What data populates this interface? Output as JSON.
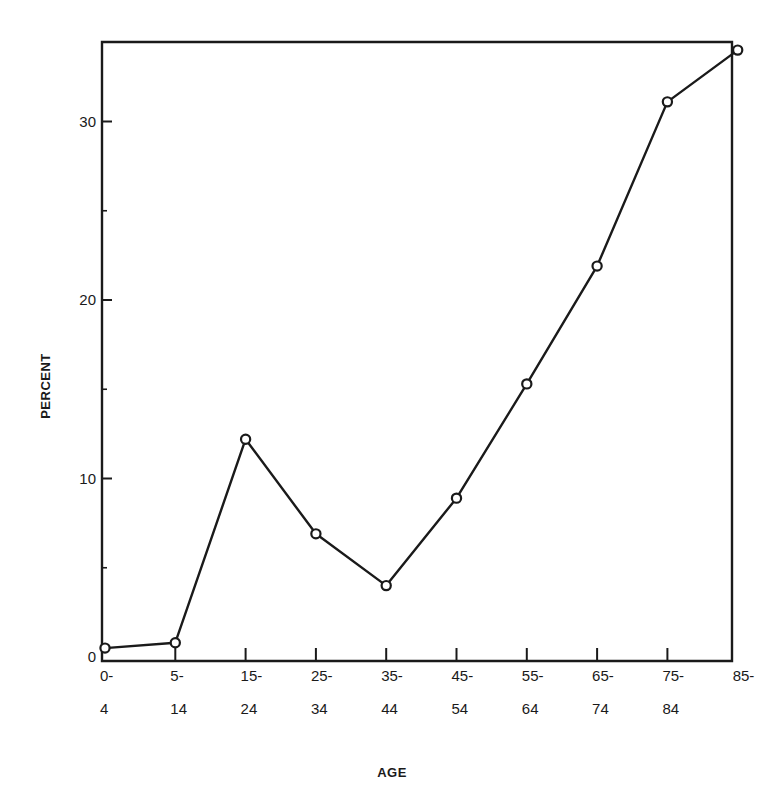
{
  "chart_data": {
    "type": "line",
    "title": "",
    "xlabel": "AGE",
    "ylabel": "PERCENT",
    "categories": [
      "0-4",
      "5-14",
      "15-24",
      "25-34",
      "35-44",
      "45-54",
      "55-64",
      "65-74",
      "75-84",
      "85-"
    ],
    "category_labels": [
      [
        "0-",
        "4"
      ],
      [
        "5-",
        "14"
      ],
      [
        "15-",
        "24"
      ],
      [
        "25-",
        "34"
      ],
      [
        "35-",
        "44"
      ],
      [
        "45-",
        "54"
      ],
      [
        "55-",
        "64"
      ],
      [
        "65-",
        "74"
      ],
      [
        "75-",
        "84"
      ],
      [
        "85-",
        ""
      ]
    ],
    "series": [
      {
        "name": "Percent",
        "values": [
          0.5,
          0.8,
          12.2,
          6.9,
          4.0,
          8.9,
          15.3,
          21.9,
          31.1,
          34.0
        ],
        "marker": "open-circle",
        "color": "#1a1a1a"
      }
    ],
    "ylim": [
      0,
      35
    ],
    "yticks": [
      0,
      10,
      20,
      30
    ],
    "yticks_minor": [
      5,
      15,
      25
    ],
    "grid": false,
    "legend": "none"
  }
}
